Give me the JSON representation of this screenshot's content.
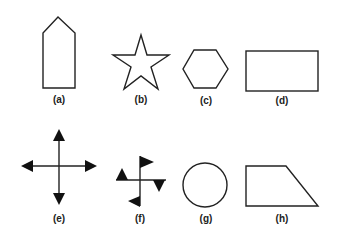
{
  "figure": {
    "background": "#ffffff",
    "stroke_color": "#222222",
    "shapes": [
      {
        "id": "a",
        "label": "(a)",
        "shape": "pentagon-house"
      },
      {
        "id": "b",
        "label": "(b)",
        "shape": "five-point-star"
      },
      {
        "id": "c",
        "label": "(c)",
        "shape": "hexagon"
      },
      {
        "id": "d",
        "label": "(d)",
        "shape": "rectangle"
      },
      {
        "id": "e",
        "label": "(e)",
        "shape": "four-way-arrow-cross"
      },
      {
        "id": "f",
        "label": "(f)",
        "shape": "pinwheel-flags"
      },
      {
        "id": "g",
        "label": "(g)",
        "shape": "circle"
      },
      {
        "id": "h",
        "label": "(h)",
        "shape": "right-trapezoid"
      }
    ]
  }
}
